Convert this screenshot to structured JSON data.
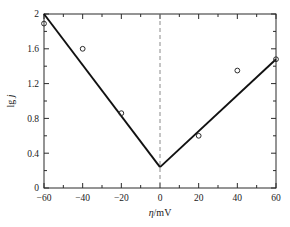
{
  "chart_data": {
    "type": "scatter",
    "title": "",
    "xlabel": "η/mV",
    "ylabel": "lg j",
    "xlim": [
      -60,
      60
    ],
    "ylim": [
      0,
      2
    ],
    "grid": false,
    "legend": "none",
    "xticks": [
      -60,
      -40,
      -20,
      0,
      20,
      40,
      60
    ],
    "xtick_labels": [
      "−60",
      "−40",
      "−20",
      "0",
      "20",
      "40",
      "60"
    ],
    "xminor_ticks": [
      -50,
      -30,
      -10,
      10,
      30,
      50
    ],
    "yticks": [
      0,
      0.4,
      0.8,
      1.2,
      1.6,
      2
    ],
    "ytick_labels": [
      "0",
      "0.4",
      "0.8",
      "1.2",
      "1.6",
      "2"
    ],
    "yminor_ticks": [
      0.2,
      0.6,
      1.0,
      1.4,
      1.8
    ],
    "series": [
      {
        "name": "measured points",
        "marker": "open-circle",
        "x": [
          -60,
          -40,
          -20,
          20,
          40,
          60
        ],
        "y": [
          1.89,
          1.6,
          0.86,
          0.6,
          1.35,
          1.48
        ]
      },
      {
        "name": "cathodic Tafel fit",
        "type": "line",
        "x": [
          -60,
          0
        ],
        "y": [
          2.0,
          0.24
        ]
      },
      {
        "name": "anodic Tafel fit",
        "type": "line",
        "x": [
          0,
          60
        ],
        "y": [
          0.24,
          1.48
        ]
      }
    ],
    "annotations": [
      {
        "kind": "vertical-dashed-line",
        "x": 0,
        "label": "zero overpotential reference"
      }
    ]
  },
  "axis_labels": {
    "x_symbol": "η",
    "x_unit": "/mV",
    "y_prefix": "lg ",
    "y_symbol": "j"
  },
  "colors": {
    "axis": "#2b2b2b",
    "fit_line": "#111111",
    "reference_line": "#8a8a8a",
    "marker_stroke": "#2b2b2b",
    "background": "#ffffff"
  }
}
